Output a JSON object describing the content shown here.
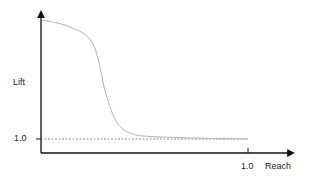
{
  "chart_data": {
    "type": "line",
    "title": "",
    "xlabel": "Reach",
    "ylabel": "Lift",
    "x_ticks": [
      "1.0"
    ],
    "y_ticks": [
      "1.0"
    ],
    "xlim": [
      0,
      1.0
    ],
    "grid": false,
    "legend": null,
    "series": [
      {
        "name": "Lift curve",
        "color": "#b0b0b0",
        "x": [
          0.0,
          0.1,
          0.2,
          0.25,
          0.28,
          0.3,
          0.33,
          0.36,
          0.4,
          0.45,
          0.5,
          0.6,
          0.8,
          1.0
        ],
        "y": [
          9.1,
          8.8,
          8.2,
          7.4,
          6.0,
          4.6,
          3.2,
          2.2,
          1.6,
          1.3,
          1.2,
          1.12,
          1.05,
          1.0
        ]
      },
      {
        "name": "Baseline (Lift = 1.0)",
        "style": "dashed",
        "color": "#777777",
        "x": [
          0.0,
          1.0
        ],
        "y": [
          1.0,
          1.0
        ]
      }
    ],
    "annotations": []
  },
  "labels": {
    "y_axis": "Lift",
    "x_axis": "Reach",
    "y_tick": "1.0",
    "x_tick": "1.0"
  }
}
